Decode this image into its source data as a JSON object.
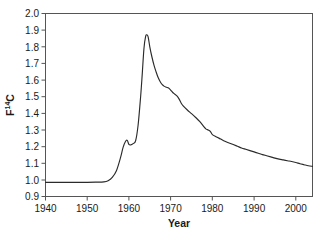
{
  "figure": {
    "background_color": "#ffffff",
    "axis_color": "#555555",
    "curve_color": "#2b2b2b",
    "caption_fragment": ""
  },
  "axes": {
    "y_label_prefix": "F",
    "y_label_superscript": "14",
    "y_label_suffix": "C",
    "x_label": "Year"
  },
  "chart_data": {
    "type": "line",
    "title": "",
    "xlabel": "Year",
    "ylabel": "F14C",
    "xlim": [
      1940,
      2004
    ],
    "ylim": [
      0.9,
      2.0
    ],
    "xticks": [
      1940,
      1950,
      1960,
      1970,
      1980,
      1990,
      2000
    ],
    "xtick_labels": [
      "1940",
      "1950",
      "1960",
      "1970",
      "1980",
      "1990",
      "2000"
    ],
    "yticks": [
      0.9,
      1.0,
      1.1,
      1.2,
      1.3,
      1.4,
      1.5,
      1.6,
      1.7,
      1.8,
      1.9,
      2.0
    ],
    "ytick_labels": [
      "0.9",
      "1.0",
      "1.1",
      "1.2",
      "1.3",
      "1.4",
      "1.5",
      "1.6",
      "1.7",
      "1.8",
      "1.9",
      "2.0"
    ],
    "grid": false,
    "legend": false,
    "legend_position": "none",
    "series": [
      {
        "name": "F14C atmospheric bomb pulse",
        "x": [
          1940,
          1942,
          1944,
          1946,
          1948,
          1950,
          1952,
          1954,
          1955,
          1956,
          1957,
          1958,
          1958.6,
          1959.2,
          1959.6,
          1960.0,
          1960.4,
          1961.0,
          1961.6,
          1962.2,
          1962.8,
          1963.2,
          1963.6,
          1964.0,
          1964.3,
          1964.6,
          1965.0,
          1965.5,
          1966.0,
          1966.5,
          1967.0,
          1967.5,
          1968.0,
          1968.5,
          1969.0,
          1969.5,
          1970.0,
          1970.5,
          1971.0,
          1971.5,
          1972.0,
          1972.5,
          1973.0,
          1974.0,
          1975.0,
          1976.0,
          1977.0,
          1978.0,
          1978.5,
          1979.0,
          1979.5,
          1980.0,
          1981.0,
          1982.0,
          1983.0,
          1984.0,
          1985.0,
          1986.0,
          1987.0,
          1988.0,
          1989.0,
          1990.0,
          1991.0,
          1992.0,
          1993.0,
          1994.0,
          1995.0,
          1996.0,
          1997.0,
          1998.0,
          1999.0,
          2000.0,
          2001.0,
          2002.0,
          2003.0,
          2004.0
        ],
        "y": [
          0.985,
          0.985,
          0.985,
          0.985,
          0.985,
          0.985,
          0.986,
          0.988,
          0.995,
          1.015,
          1.055,
          1.135,
          1.195,
          1.232,
          1.237,
          1.213,
          1.21,
          1.218,
          1.235,
          1.33,
          1.5,
          1.64,
          1.79,
          1.862,
          1.872,
          1.86,
          1.8,
          1.74,
          1.69,
          1.65,
          1.615,
          1.59,
          1.572,
          1.562,
          1.557,
          1.552,
          1.54,
          1.525,
          1.515,
          1.505,
          1.487,
          1.462,
          1.445,
          1.42,
          1.398,
          1.375,
          1.35,
          1.318,
          1.305,
          1.3,
          1.292,
          1.272,
          1.258,
          1.245,
          1.232,
          1.222,
          1.212,
          1.202,
          1.192,
          1.184,
          1.176,
          1.168,
          1.16,
          1.152,
          1.145,
          1.138,
          1.131,
          1.125,
          1.12,
          1.115,
          1.11,
          1.104,
          1.097,
          1.091,
          1.085,
          1.081
        ]
      }
    ]
  }
}
